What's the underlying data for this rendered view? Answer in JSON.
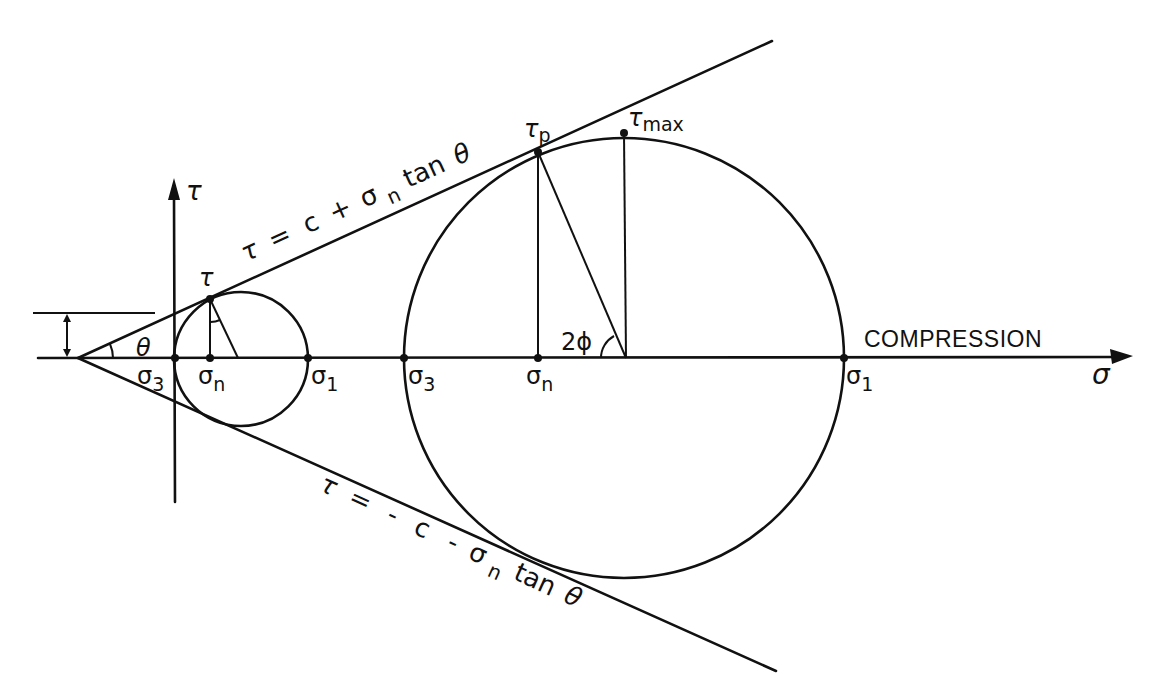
{
  "diagram": {
    "axes": {
      "x_label": "σ",
      "y_label": "τ",
      "x_annotation": "COMPRESSION"
    },
    "envelope": {
      "upper_equation": {
        "lhs": "τ",
        "eq": "=",
        "c": "c",
        "plus": "+",
        "sigma": "σ",
        "sub": "n",
        "tan": "tan",
        "theta": "θ"
      },
      "lower_equation": {
        "lhs": "τ",
        "eq": "=",
        "neg": "-",
        "c": "c",
        "minus": "-",
        "sigma": "σ",
        "sub": "n",
        "tan": "tan",
        "theta": "θ"
      },
      "angle_label": "θ"
    },
    "small_circle": {
      "sigma3": {
        "base": "σ",
        "sub": "3"
      },
      "sigma_n": {
        "base": "σ",
        "sub": "n"
      },
      "sigma1": {
        "base": "σ",
        "sub": "1"
      },
      "tau": "τ"
    },
    "large_circle": {
      "sigma3": {
        "base": "σ",
        "sub": "3"
      },
      "sigma_n": {
        "base": "σ",
        "sub": "n"
      },
      "sigma1": {
        "base": "σ",
        "sub": "1"
      },
      "tau_p": {
        "base": "τ",
        "sub": "p"
      },
      "tau_max": {
        "base": "τ",
        "sub": "max"
      },
      "angle_label": "2ϕ"
    },
    "colors": {
      "ink": "#111111",
      "paper": "#ffffff"
    }
  }
}
